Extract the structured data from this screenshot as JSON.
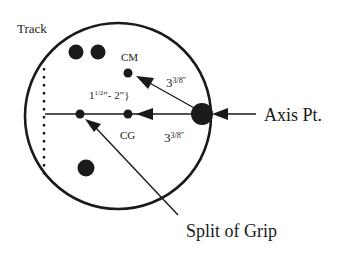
{
  "diagram": {
    "type": "bowling-ball-grip-layout",
    "labels": {
      "track": "Track",
      "cm": "CM",
      "cg": "CG",
      "axis_point": "Axis Pt.",
      "split_of_grip": "Split of Grip"
    },
    "dimensions": {
      "grip_range": {
        "whole": "1",
        "frac": "1/2",
        "rest": "″- 2″}"
      },
      "axis_to_cm": {
        "whole": "3",
        "frac": "3/8″"
      },
      "axis_to_cg": {
        "whole": "3",
        "frac": "3/8″"
      }
    },
    "colors": {
      "ink": "#1a1a1a",
      "background": "#ffffff"
    }
  }
}
